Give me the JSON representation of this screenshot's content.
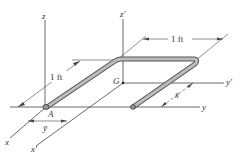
{
  "diagram": {
    "type": "3d-rod-centroid",
    "labels": {
      "z": "z",
      "z_prime": "z′",
      "y": "y",
      "y_prime": "y′",
      "x": "x",
      "x_prime": "x′",
      "origin": "A",
      "centroid": "G",
      "x_bar": "x̄",
      "y_bar": "ȳ"
    },
    "dimensions": {
      "length_top": "1 ft",
      "length_side": "1 ft"
    },
    "colors": {
      "rod_fill": "#b8b8b8",
      "rod_edge": "#555555",
      "line": "#444444"
    }
  }
}
